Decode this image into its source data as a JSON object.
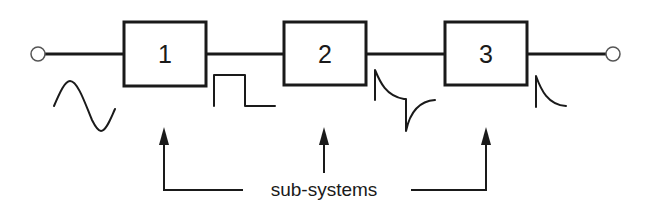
{
  "diagram": {
    "type": "signal-chain block diagram",
    "input_terminal": {
      "x": 38,
      "y": 54
    },
    "output_terminal": {
      "x": 613,
      "y": 54
    },
    "blocks": [
      {
        "label": "1",
        "x": 124,
        "y": 22,
        "w": 82,
        "h": 64
      },
      {
        "label": "2",
        "x": 284,
        "y": 22,
        "w": 82,
        "h": 63
      },
      {
        "label": "3",
        "x": 445,
        "y": 22,
        "w": 82,
        "h": 63
      }
    ],
    "waveforms": [
      {
        "name": "sine",
        "position": "input"
      },
      {
        "name": "square-pulse",
        "position": "after block 1"
      },
      {
        "name": "differentiated-spikes",
        "position": "after block 2"
      },
      {
        "name": "single-decaying-spike",
        "position": "after block 3"
      }
    ],
    "caption": "sub-systems"
  }
}
